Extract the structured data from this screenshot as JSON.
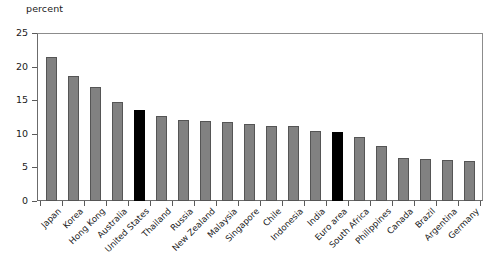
{
  "chart_data": {
    "type": "bar",
    "title": "",
    "subtitle": "",
    "xlabel": "",
    "ylabel": "percent",
    "unit_label": "percent",
    "ylim": [
      0,
      25
    ],
    "yticks": [
      0,
      5,
      10,
      15,
      20,
      25
    ],
    "ytick_labels": [
      "0",
      "5",
      "10",
      "15",
      "20",
      "25"
    ],
    "grid": false,
    "legend": "none",
    "categories": [
      "Japan",
      "Korea",
      "Hong Kong",
      "Australia",
      "United States",
      "Thailand",
      "Russia",
      "New Zealand",
      "Malaysia",
      "Singapore",
      "Chile",
      "Indonesia",
      "India",
      "Euro area",
      "South Africa",
      "Philippines",
      "Canada",
      "Brazil",
      "Argentina",
      "Germany"
    ],
    "values": [
      21.5,
      18.6,
      16.9,
      14.7,
      13.5,
      12.7,
      12.1,
      11.9,
      11.8,
      11.4,
      11.1,
      11.1,
      10.4,
      10.2,
      9.5,
      8.2,
      6.4,
      6.3,
      6.1,
      6.0
    ],
    "highlighted_categories": [
      "United States",
      "Euro area"
    ],
    "colors": {
      "bar_fill": "#818181",
      "bar_border": "#555555",
      "highlight_fill": "#000000",
      "axis": "#5a5a5a",
      "frame": "#8c8c8c",
      "text": "#1a1a1a",
      "background": "#ffffff"
    }
  }
}
